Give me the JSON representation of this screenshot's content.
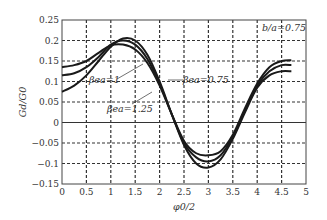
{
  "chart_data": {
    "type": "line",
    "title": "",
    "xlabel": "φ0/2",
    "ylabel": "Gd/G0",
    "xlim": [
      0,
      5
    ],
    "ylim": [
      -0.15,
      0.25
    ],
    "xticks": [
      "0",
      "0.5",
      "1",
      "1.5",
      "2",
      "2.5",
      "3",
      "3.5",
      "4",
      "4.5",
      "5"
    ],
    "yticks": [
      "−0.15",
      "−0.1",
      "−0.05",
      "0",
      "0.05",
      "0.1",
      "0.15",
      "0.2",
      "0.25"
    ],
    "grid": true,
    "annotations": [
      "b/a=0.75",
      "βea=1",
      "βea=0.75",
      "βea=1.25"
    ],
    "x": [
      0,
      0.25,
      0.5,
      0.75,
      1.0,
      1.25,
      1.5,
      1.75,
      2.0,
      2.25,
      2.5,
      2.75,
      3.0,
      3.25,
      3.5,
      3.75,
      4.0,
      4.25,
      4.5,
      4.7
    ],
    "series": [
      {
        "name": "βea=0.75",
        "values": [
          0.075,
          0.09,
          0.115,
          0.15,
          0.185,
          0.205,
          0.2,
          0.165,
          0.1,
          0.02,
          -0.055,
          -0.1,
          -0.11,
          -0.09,
          -0.04,
          0.025,
          0.085,
          0.115,
          0.125,
          0.125
        ]
      },
      {
        "name": "βea=1",
        "values": [
          0.115,
          0.12,
          0.135,
          0.16,
          0.19,
          0.2,
          0.19,
          0.155,
          0.095,
          0.02,
          -0.05,
          -0.085,
          -0.095,
          -0.08,
          -0.035,
          0.03,
          0.09,
          0.125,
          0.14,
          0.14
        ]
      },
      {
        "name": "βea=1.25",
        "values": [
          0.135,
          0.14,
          0.15,
          0.17,
          0.188,
          0.19,
          0.178,
          0.145,
          0.09,
          0.02,
          -0.045,
          -0.075,
          -0.08,
          -0.07,
          -0.03,
          0.035,
          0.095,
          0.135,
          0.15,
          0.152
        ]
      }
    ]
  },
  "labels": {
    "xlabel": "φ0/2",
    "ylabel": "Gd/G0",
    "ba": "b/a=0.75",
    "beta1": "βea=1",
    "beta075": "βea=0.75",
    "beta125": "βea=1.25"
  }
}
